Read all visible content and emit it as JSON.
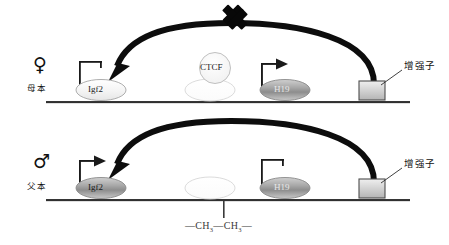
{
  "figure": {
    "background": "#ffffff"
  },
  "panels": [
    {
      "id": "maternal",
      "sex_symbol": "♀",
      "sex_symbol_name": "female-symbol",
      "sex_label": "母本",
      "genes": [
        {
          "id": "igf2",
          "label": "Igf2",
          "regulation": "repressed",
          "regulator_icon": "inhibition-bar"
        },
        {
          "id": "icr",
          "label": "",
          "regulation": "unmethylated",
          "regulator_icon": "none"
        },
        {
          "id": "h19",
          "label": "H19",
          "regulation": "active",
          "regulator_icon": "activation-arrow"
        }
      ],
      "ctcf": {
        "label": "CTCF",
        "bound": true
      },
      "enhancer": {
        "label": "增强子",
        "shape": "rectangle"
      },
      "arc": {
        "direction": "enhancer-to-igf2",
        "blocked": true,
        "block_icon": "x-cross"
      },
      "methylation": null
    },
    {
      "id": "paternal",
      "sex_symbol": "♂",
      "sex_symbol_name": "male-symbol",
      "sex_label": "父本",
      "genes": [
        {
          "id": "igf2",
          "label": "Igf2",
          "regulation": "active",
          "regulator_icon": "activation-arrow"
        },
        {
          "id": "icr",
          "label": "",
          "regulation": "methylated",
          "regulator_icon": "none"
        },
        {
          "id": "h19",
          "label": "H19",
          "regulation": "repressed",
          "regulator_icon": "inhibition-bar"
        }
      ],
      "ctcf": {
        "label": "",
        "bound": false
      },
      "enhancer": {
        "label": "增强子",
        "shape": "rectangle"
      },
      "arc": {
        "direction": "enhancer-to-igf2",
        "blocked": false,
        "block_icon": "none"
      },
      "methylation": {
        "label_prefix": "—CH",
        "label_sub": "3",
        "label_mid": "—CH",
        "label_suffix": "—",
        "full": "—CH3—CH3—"
      }
    }
  ],
  "colors": {
    "line": "#1a1a1a",
    "arc": "#0d0d0d",
    "gene_fill_light": "#f2f2f2",
    "gene_fill_dark": "#8f8f8f",
    "gene_stroke": "#9a9a9a",
    "enhancer_fill": "#d9d9d9",
    "enhancer_stroke": "#4d4d4d",
    "ctcf_fill": "#fafafa",
    "ctcf_stroke": "#b3b3b3",
    "text": "#1a1a1a"
  }
}
